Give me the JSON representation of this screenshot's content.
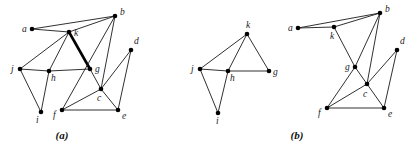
{
  "figure": {
    "panels": [
      {
        "id": "a",
        "caption": "(a)",
        "caption_pos": [
          62,
          139
        ],
        "nodes": [
          {
            "id": "a",
            "label": "a",
            "x": 32,
            "y": 29,
            "lx": -10,
            "ly": 3
          },
          {
            "id": "b",
            "label": "b",
            "x": 115,
            "y": 16,
            "lx": 5,
            "ly": -1
          },
          {
            "id": "k",
            "label": "k",
            "x": 69,
            "y": 32,
            "lx": 5,
            "ly": 4
          },
          {
            "id": "d",
            "label": "d",
            "x": 131,
            "y": 50,
            "lx": 3,
            "ly": -6
          },
          {
            "id": "j",
            "label": "j",
            "x": 20,
            "y": 69,
            "lx": -9,
            "ly": 3
          },
          {
            "id": "h",
            "label": "h",
            "x": 49,
            "y": 71,
            "lx": 2,
            "ly": 10
          },
          {
            "id": "g",
            "label": "g",
            "x": 90,
            "y": 69,
            "lx": 5,
            "ly": 3
          },
          {
            "id": "c",
            "label": "c",
            "x": 101,
            "y": 89,
            "lx": -4,
            "ly": 12
          },
          {
            "id": "i",
            "label": "i",
            "x": 41,
            "y": 112,
            "lx": -5,
            "ly": 11
          },
          {
            "id": "f",
            "label": "f",
            "x": 62,
            "y": 110,
            "lx": -9,
            "ly": 8
          },
          {
            "id": "e",
            "label": "e",
            "x": 118,
            "y": 110,
            "lx": 4,
            "ly": 9
          }
        ],
        "edges": [
          {
            "from": "a",
            "to": "b"
          },
          {
            "from": "a",
            "to": "k"
          },
          {
            "from": "k",
            "to": "b"
          },
          {
            "from": "k",
            "to": "j"
          },
          {
            "from": "k",
            "to": "h"
          },
          {
            "from": "k",
            "to": "g",
            "thick": true
          },
          {
            "from": "b",
            "to": "f"
          },
          {
            "from": "b",
            "to": "c"
          },
          {
            "from": "j",
            "to": "h"
          },
          {
            "from": "h",
            "to": "g"
          },
          {
            "from": "j",
            "to": "i"
          },
          {
            "from": "h",
            "to": "i"
          },
          {
            "from": "g",
            "to": "c"
          },
          {
            "from": "f",
            "to": "c"
          },
          {
            "from": "f",
            "to": "e"
          },
          {
            "from": "c",
            "to": "e"
          },
          {
            "from": "c",
            "to": "d"
          },
          {
            "from": "d",
            "to": "e"
          }
        ]
      },
      {
        "id": "b-left",
        "caption": "",
        "nodes": [
          {
            "id": "k",
            "label": "k",
            "x": 247,
            "y": 34,
            "lx": -1,
            "ly": -6
          },
          {
            "id": "j",
            "label": "j",
            "x": 200,
            "y": 69,
            "lx": -9,
            "ly": 3
          },
          {
            "id": "h",
            "label": "h",
            "x": 228,
            "y": 71,
            "lx": 2,
            "ly": 10
          },
          {
            "id": "g",
            "label": "g",
            "x": 269,
            "y": 71,
            "lx": 4,
            "ly": 4
          },
          {
            "id": "i",
            "label": "i",
            "x": 218,
            "y": 113,
            "lx": -2,
            "ly": 11
          }
        ],
        "edges": [
          {
            "from": "k",
            "to": "j"
          },
          {
            "from": "k",
            "to": "h"
          },
          {
            "from": "k",
            "to": "g"
          },
          {
            "from": "j",
            "to": "h"
          },
          {
            "from": "h",
            "to": "g"
          },
          {
            "from": "j",
            "to": "i"
          },
          {
            "from": "h",
            "to": "i"
          }
        ]
      },
      {
        "id": "b-right",
        "caption": "(b)",
        "caption_pos": [
          297,
          139
        ],
        "nodes": [
          {
            "id": "a",
            "label": "a",
            "x": 298,
            "y": 28,
            "lx": -10,
            "ly": 3
          },
          {
            "id": "b",
            "label": "b",
            "x": 380,
            "y": 13,
            "lx": 5,
            "ly": -1
          },
          {
            "id": "k",
            "label": "k",
            "x": 334,
            "y": 27,
            "lx": -4,
            "ly": 12
          },
          {
            "id": "d",
            "label": "d",
            "x": 397,
            "y": 50,
            "lx": 3,
            "ly": -6
          },
          {
            "id": "g",
            "label": "g",
            "x": 355,
            "y": 67,
            "lx": -10,
            "ly": 3
          },
          {
            "id": "c",
            "label": "c",
            "x": 367,
            "y": 84,
            "lx": -4,
            "ly": 13
          },
          {
            "id": "f",
            "label": "f",
            "x": 327,
            "y": 108,
            "lx": -9,
            "ly": 8
          },
          {
            "id": "e",
            "label": "e",
            "x": 384,
            "y": 108,
            "lx": 4,
            "ly": 9
          }
        ],
        "edges": [
          {
            "from": "a",
            "to": "b"
          },
          {
            "from": "a",
            "to": "k"
          },
          {
            "from": "k",
            "to": "b"
          },
          {
            "from": "k",
            "to": "g"
          },
          {
            "from": "g",
            "to": "c"
          },
          {
            "from": "b",
            "to": "g"
          },
          {
            "from": "g",
            "to": "f"
          },
          {
            "from": "b",
            "to": "c"
          },
          {
            "from": "f",
            "to": "c"
          },
          {
            "from": "f",
            "to": "e"
          },
          {
            "from": "c",
            "to": "e"
          },
          {
            "from": "c",
            "to": "d"
          },
          {
            "from": "d",
            "to": "e"
          }
        ]
      }
    ]
  }
}
